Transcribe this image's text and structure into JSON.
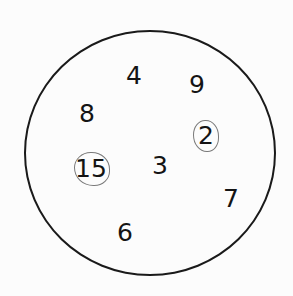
{
  "diagram": {
    "shape": "circle",
    "numbers": [
      {
        "value": "4",
        "x": 134,
        "y": 75,
        "circled": false
      },
      {
        "value": "9",
        "x": 197,
        "y": 84,
        "circled": false
      },
      {
        "value": "8",
        "x": 87,
        "y": 113,
        "circled": false
      },
      {
        "value": "2",
        "x": 206,
        "y": 135,
        "circled": true
      },
      {
        "value": "15",
        "x": 91,
        "y": 168,
        "circled": true
      },
      {
        "value": "3",
        "x": 160,
        "y": 165,
        "circled": false
      },
      {
        "value": "7",
        "x": 231,
        "y": 198,
        "circled": false
      },
      {
        "value": "6",
        "x": 125,
        "y": 232,
        "circled": false
      }
    ],
    "colors": {
      "ink": "#141414",
      "pen_mark": "#7a7a7a"
    }
  }
}
